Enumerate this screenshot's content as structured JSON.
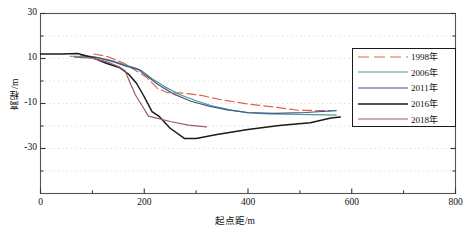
{
  "chart_data": {
    "type": "line",
    "title": "",
    "xlabel": "起点距/m",
    "ylabel": "高程/m",
    "xlim": [
      0,
      800
    ],
    "ylim": [
      -50,
      30
    ],
    "xticks": [
      0,
      200,
      400,
      600,
      800
    ],
    "xtick_labels": [
      "0",
      "200",
      "400",
      "600",
      "800"
    ],
    "xminor": [
      100,
      300,
      500,
      700
    ],
    "yticks": [
      30,
      10,
      -10,
      -30
    ],
    "ytick_labels": [
      "30",
      "10",
      "-10",
      "-30"
    ],
    "yminor": [
      20,
      0,
      -20,
      -40
    ],
    "grid": "dotted-minor-and-major",
    "legend_position": "upper-right-inside",
    "series": [
      {
        "name": "1998年",
        "color": "#e0644a",
        "style": "dashed",
        "points": [
          [
            103,
            12.0
          ],
          [
            130,
            10.8
          ],
          [
            160,
            8.0
          ],
          [
            185,
            4.5
          ],
          [
            205,
            1.5
          ],
          [
            225,
            -3.2
          ],
          [
            245,
            -5.2
          ],
          [
            275,
            -5.4
          ],
          [
            310,
            -6.4
          ],
          [
            350,
            -8.4
          ],
          [
            400,
            -10.2
          ],
          [
            450,
            -11.6
          ],
          [
            497,
            -13.0
          ],
          [
            560,
            -13.2
          ]
        ]
      },
      {
        "name": "2006年",
        "color": "#4b9c8f",
        "style": "solid",
        "points": [
          [
            57,
            11.0
          ],
          [
            100,
            10.8
          ],
          [
            135,
            9.2
          ],
          [
            160,
            7.4
          ],
          [
            180,
            6.0
          ],
          [
            195,
            4.6
          ],
          [
            215,
            1.0
          ],
          [
            240,
            -2.6
          ],
          [
            268,
            -6.0
          ],
          [
            300,
            -8.8
          ],
          [
            330,
            -11.0
          ],
          [
            365,
            -12.8
          ],
          [
            400,
            -14.2
          ],
          [
            440,
            -14.6
          ],
          [
            500,
            -14.8
          ],
          [
            570,
            -15.2
          ]
        ]
      },
      {
        "name": "2011年",
        "color": "#41558c",
        "style": "solid",
        "points": [
          [
            77,
            11.6
          ],
          [
            110,
            10.4
          ],
          [
            140,
            8.6
          ],
          [
            165,
            6.6
          ],
          [
            188,
            5.2
          ],
          [
            205,
            2.2
          ],
          [
            228,
            -1.8
          ],
          [
            255,
            -5.6
          ],
          [
            290,
            -9.0
          ],
          [
            325,
            -11.2
          ],
          [
            360,
            -12.8
          ],
          [
            400,
            -14.0
          ],
          [
            450,
            -14.4
          ],
          [
            510,
            -14.0
          ],
          [
            570,
            -13.2
          ]
        ]
      },
      {
        "name": "2016年",
        "color": "#1a1a1a",
        "style": "solid",
        "points": [
          [
            0,
            12.0
          ],
          [
            40,
            12.0
          ],
          [
            72,
            12.2
          ],
          [
            100,
            10.4
          ],
          [
            128,
            7.8
          ],
          [
            152,
            6.0
          ],
          [
            170,
            3.0
          ],
          [
            185,
            -1.0
          ],
          [
            200,
            -7.0
          ],
          [
            215,
            -13.6
          ],
          [
            228,
            -15.6
          ],
          [
            250,
            -21.0
          ],
          [
            278,
            -25.6
          ],
          [
            300,
            -25.6
          ],
          [
            340,
            -23.8
          ],
          [
            400,
            -21.6
          ],
          [
            460,
            -19.8
          ],
          [
            520,
            -18.6
          ],
          [
            560,
            -16.4
          ],
          [
            578,
            -16.0
          ]
        ]
      },
      {
        "name": "2018年",
        "color": "#9e5a68",
        "style": "solid",
        "points": [
          [
            65,
            10.6
          ],
          [
            100,
            10.2
          ],
          [
            130,
            8.4
          ],
          [
            152,
            6.2
          ],
          [
            163,
            4.6
          ],
          [
            172,
            -0.4
          ],
          [
            183,
            -6.2
          ],
          [
            196,
            -11.0
          ],
          [
            208,
            -15.6
          ],
          [
            222,
            -16.4
          ],
          [
            250,
            -18.0
          ],
          [
            285,
            -19.6
          ],
          [
            320,
            -20.4
          ]
        ]
      }
    ]
  }
}
